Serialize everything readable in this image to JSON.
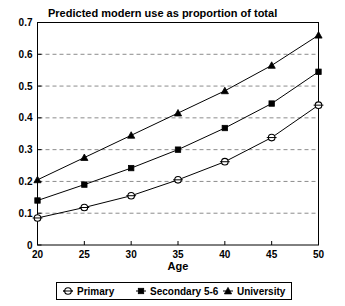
{
  "chart_data": {
    "type": "line",
    "title": "Predicted modern use as proportion of total",
    "xlabel": "Age",
    "ylabel": "",
    "x": [
      20,
      25,
      30,
      35,
      40,
      45,
      50
    ],
    "xtick_labels": [
      "20",
      "25",
      "30",
      "35",
      "40",
      "45",
      "50"
    ],
    "ytick_labels": [
      "0",
      "0.1",
      "0.2",
      "0.3",
      "0.4",
      "0.5",
      "0.6",
      "0.7"
    ],
    "yticks": [
      0,
      0.1,
      0.2,
      0.3,
      0.4,
      0.5,
      0.6,
      0.7
    ],
    "xlim": [
      20,
      50
    ],
    "ylim": [
      0,
      0.7
    ],
    "grid": "horizontal-dashed",
    "legend_position": "bottom",
    "series": [
      {
        "name": "Primary",
        "marker": "open-circle",
        "values": [
          0.085,
          0.118,
          0.155,
          0.205,
          0.262,
          0.338,
          0.44
        ]
      },
      {
        "name": "Secondary 5-6",
        "marker": "filled-square",
        "values": [
          0.14,
          0.19,
          0.242,
          0.3,
          0.368,
          0.445,
          0.545
        ]
      },
      {
        "name": "University",
        "marker": "filled-triangle",
        "values": [
          0.205,
          0.275,
          0.345,
          0.415,
          0.485,
          0.565,
          0.66
        ]
      }
    ]
  },
  "colors": {
    "background": "#ffffff",
    "foreground": "#000000",
    "gridline": "#8c8c8c"
  }
}
